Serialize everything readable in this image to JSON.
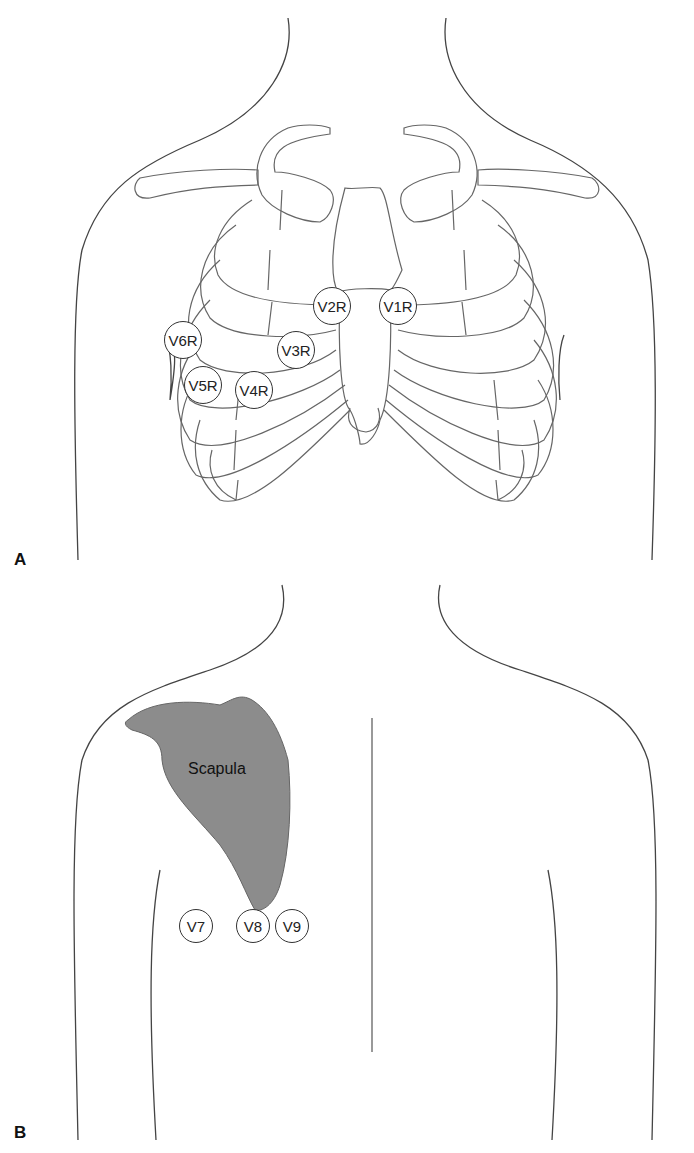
{
  "figure": {
    "panels": [
      {
        "label": "A",
        "view": "anterior chest",
        "leads": [
          {
            "name": "V1R",
            "cx": 398,
            "cy": 306,
            "r": 19
          },
          {
            "name": "V2R",
            "cx": 332,
            "cy": 306,
            "r": 19
          },
          {
            "name": "V3R",
            "cx": 296,
            "cy": 350,
            "r": 19
          },
          {
            "name": "V4R",
            "cx": 254,
            "cy": 390,
            "r": 19
          },
          {
            "name": "V5R",
            "cx": 203,
            "cy": 385,
            "r": 19
          },
          {
            "name": "V6R",
            "cx": 183,
            "cy": 340,
            "r": 19
          }
        ]
      },
      {
        "label": "B",
        "view": "posterior chest",
        "structure_label": "Scapula",
        "leads": [
          {
            "name": "V7",
            "cx": 196,
            "cy": 926,
            "r": 17
          },
          {
            "name": "V8",
            "cx": 253,
            "cy": 926,
            "r": 17
          },
          {
            "name": "V9",
            "cx": 292,
            "cy": 926,
            "r": 17
          }
        ]
      }
    ],
    "colors": {
      "line": "#555555",
      "scapula_fill": "#8c8c8c",
      "background": "#ffffff"
    }
  }
}
